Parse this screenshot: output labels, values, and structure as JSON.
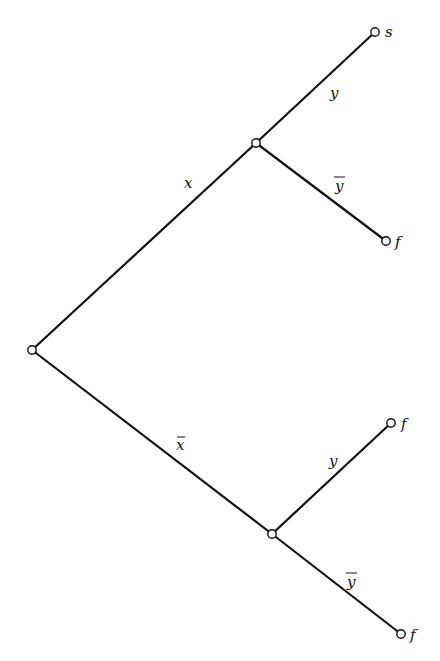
{
  "diagram": {
    "type": "binary decision tree",
    "colors": {
      "line": "#111111",
      "node_fill": "#ffffff",
      "background": "#ffffff"
    },
    "nodes": [
      {
        "id": "root",
        "x": 32,
        "y": 350,
        "label": ""
      },
      {
        "id": "n_x",
        "x": 256,
        "y": 143,
        "label": ""
      },
      {
        "id": "n_xbar",
        "x": 272,
        "y": 534,
        "label": ""
      },
      {
        "id": "leaf_xy",
        "x": 375,
        "y": 32,
        "label": "s"
      },
      {
        "id": "leaf_xybar",
        "x": 386,
        "y": 241,
        "label": "f"
      },
      {
        "id": "leaf_xbary",
        "x": 391,
        "y": 423,
        "label": "f"
      },
      {
        "id": "leaf_xbarybar",
        "x": 401,
        "y": 634,
        "label": "f"
      }
    ],
    "edges": [
      {
        "from": "root",
        "to": "n_x",
        "label": "x",
        "negated": false
      },
      {
        "from": "root",
        "to": "n_xbar",
        "label": "x",
        "negated": true
      },
      {
        "from": "n_x",
        "to": "leaf_xy",
        "label": "y",
        "negated": false
      },
      {
        "from": "n_x",
        "to": "leaf_xybar",
        "label": "y",
        "negated": true
      },
      {
        "from": "n_xbar",
        "to": "leaf_xbary",
        "label": "y",
        "negated": false
      },
      {
        "from": "n_xbar",
        "to": "leaf_xbarybar",
        "label": "y",
        "negated": true
      }
    ],
    "leaf_labels": {
      "leaf_xy": "s",
      "leaf_xybar": "f",
      "leaf_xbary": "f",
      "leaf_xbarybar": "f"
    },
    "edge_labels": {
      "x": "x",
      "xbar": "x",
      "upper_y": "y",
      "upper_ybar": "y",
      "lower_y": "y",
      "lower_ybar": "y"
    }
  }
}
